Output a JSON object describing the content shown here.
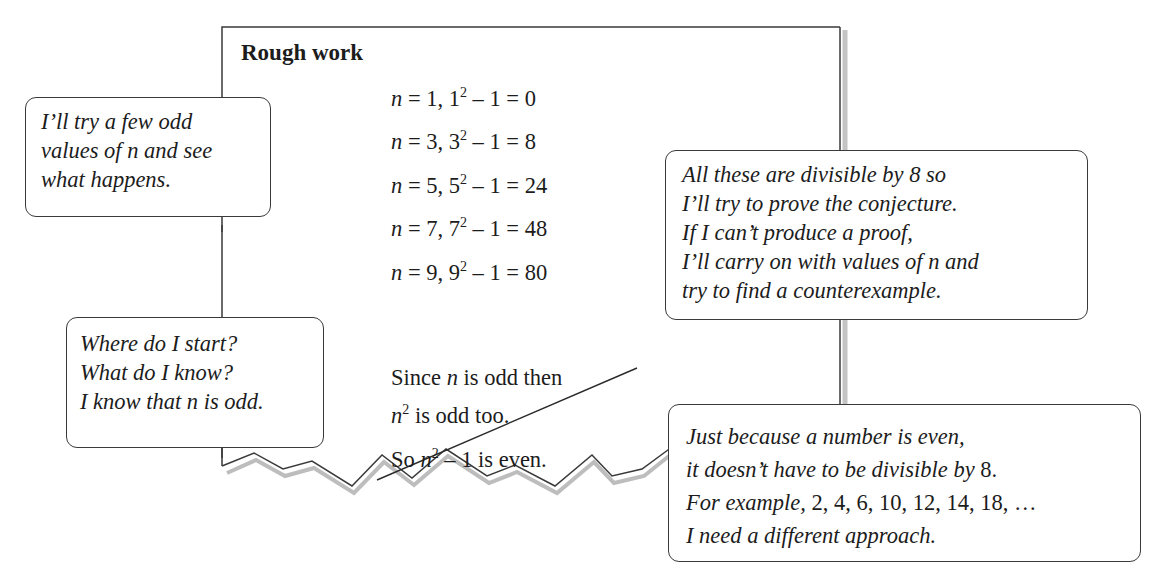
{
  "paper": {
    "title": "Rough work",
    "equations": [
      {
        "var": "n",
        "eq": " = 1,  ",
        "base": "1",
        "exp": "2",
        "rest": " – 1 = 0"
      },
      {
        "var": "n",
        "eq": " = 3,  ",
        "base": "3",
        "exp": "2",
        "rest": " – 1 = 8"
      },
      {
        "var": "n",
        "eq": " = 5,  ",
        "base": "5",
        "exp": "2",
        "rest": " – 1 = 24"
      },
      {
        "var": "n",
        "eq": " = 7,  ",
        "base": "7",
        "exp": "2",
        "rest": " – 1 = 48"
      },
      {
        "var": "n",
        "eq": " = 9,  ",
        "base": "9",
        "exp": "2",
        "rest": " – 1 = 80"
      }
    ],
    "crossed_out": {
      "line1_a": "Since ",
      "line1_var": "n",
      "line1_b": " is odd then",
      "line2_var": "n",
      "line2_exp": "2",
      "line2_b": " is odd too.",
      "line3_a": "So ",
      "line3_var": "n",
      "line3_exp": "2",
      "line3_b": " – 1 is even."
    }
  },
  "callouts": {
    "try_values": [
      "I’ll try a few odd",
      "values of n and see",
      "what happens."
    ],
    "divisible": [
      "All these are divisible by 8 so",
      "I’ll try to prove the conjecture.",
      "If I can’t produce a proof,",
      "I’ll carry on with values of n and",
      "try to find a counterexample."
    ],
    "where_start": [
      "Where do I start?",
      "What do I know?",
      "I know that n is odd."
    ],
    "just_because": {
      "line1": "Just because a number is even,",
      "line2_a": "it doesn’t have to be divisible by ",
      "line2_num": "8.",
      "line3_a": "For example, ",
      "line3_nums": "2, 4, 6, 10, 12, 14, 18, …",
      "line4": "I need a different approach."
    }
  },
  "colors": {
    "ink": "#1c1c1c",
    "border": "#3a3a3a",
    "shadow": "#b5b5b5"
  }
}
